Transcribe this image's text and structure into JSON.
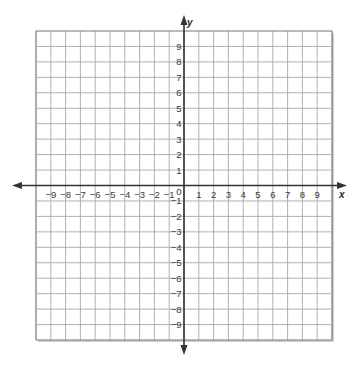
{
  "chart_data": {
    "type": "grid",
    "title": "",
    "xlabel": "x",
    "ylabel": "y",
    "xlim": [
      -10,
      10
    ],
    "ylim": [
      -10,
      10
    ],
    "grid": true,
    "grid_step": 1,
    "x_tick_labels": [
      "-9",
      "-8",
      "-7",
      "-6",
      "-5",
      "-4",
      "-3",
      "-2",
      "-1",
      "1",
      "2",
      "3",
      "4",
      "5",
      "6",
      "7",
      "8",
      "9"
    ],
    "x_ticks": [
      -9,
      -8,
      -7,
      -6,
      -5,
      -4,
      -3,
      -2,
      -1,
      1,
      2,
      3,
      4,
      5,
      6,
      7,
      8,
      9
    ],
    "y_tick_labels": [
      "9",
      "8",
      "7",
      "6",
      "5",
      "4",
      "3",
      "2",
      "1",
      "-1",
      "-2",
      "-3",
      "-4",
      "-5",
      "-6",
      "-7",
      "-8",
      "-9"
    ],
    "y_ticks": [
      9,
      8,
      7,
      6,
      5,
      4,
      3,
      2,
      1,
      -1,
      -2,
      -3,
      -4,
      -5,
      -6,
      -7,
      -8,
      -9
    ],
    "origin_label": "0",
    "series": [],
    "legend": null
  },
  "colors": {
    "grid": "#a8a8a8",
    "axis": "#333333",
    "text": "#3a3a3a",
    "shadow": "#cfcfcf"
  }
}
